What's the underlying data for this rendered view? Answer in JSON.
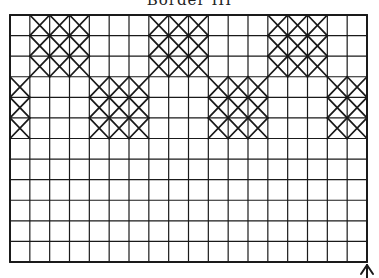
{
  "title": "Border III",
  "grid": {
    "cols": 18,
    "rows": 12,
    "left": 10,
    "top": 15,
    "right": 367,
    "bottom": 262,
    "line_color": "#1a1a1a"
  },
  "motifs": [
    {
      "col": 1,
      "row": 0,
      "w": 3,
      "h": 3
    },
    {
      "col": 7,
      "row": 0,
      "w": 3,
      "h": 3
    },
    {
      "col": 13,
      "row": 0,
      "w": 3,
      "h": 3
    },
    {
      "col": 0,
      "row": 3,
      "w": 1,
      "h": 3
    },
    {
      "col": 4,
      "row": 3,
      "w": 3,
      "h": 3
    },
    {
      "col": 10,
      "row": 3,
      "w": 3,
      "h": 3
    },
    {
      "col": 16,
      "row": 3,
      "w": 2,
      "h": 3
    }
  ],
  "arrow": {
    "label": "direction-arrow",
    "x": 367
  }
}
